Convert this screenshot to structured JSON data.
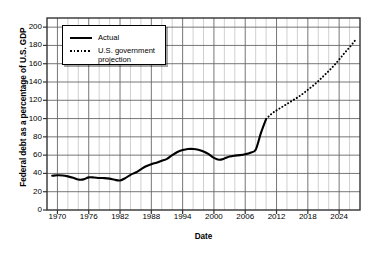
{
  "chart_data": {
    "type": "line",
    "title": "",
    "xlabel": "Date",
    "ylabel": "Federal debt as a percentage of U.S. GDP",
    "xlim": [
      1968,
      1968
    ],
    "ylim": [
      0,
      210
    ],
    "grid": true,
    "legend_position": "top-left",
    "y_ticks": [
      0,
      20,
      40,
      60,
      80,
      100,
      120,
      140,
      160,
      180,
      200
    ],
    "x_ticks": [
      1970,
      1976,
      1982,
      1988,
      1994,
      2000,
      2006,
      2012,
      2018,
      2024
    ],
    "x_minor_step": 2,
    "x_range": [
      1968,
      2028
    ],
    "legend": [
      {
        "label": "Actual",
        "style": "solid"
      },
      {
        "label": "U.S. government\nprojection",
        "style": "dotted"
      }
    ],
    "series": [
      {
        "name": "Actual",
        "style": "solid",
        "x": [
          1969,
          1970,
          1971,
          1972,
          1973,
          1974,
          1975,
          1976,
          1977,
          1978,
          1979,
          1980,
          1981,
          1982,
          1983,
          1984,
          1985,
          1986,
          1987,
          1988,
          1989,
          1990,
          1991,
          1992,
          1993,
          1994,
          1995,
          1996,
          1997,
          1998,
          1999,
          2000,
          2001,
          2002,
          2003,
          2004,
          2005,
          2006,
          2007,
          2008,
          2009,
          2010
        ],
        "values": [
          37.5,
          38.0,
          37.8,
          36.8,
          35.3,
          33.3,
          33.5,
          35.7,
          35.6,
          35.0,
          34.9,
          34.3,
          33.0,
          32.3,
          34.8,
          38.5,
          41.0,
          44.5,
          47.8,
          50.0,
          51.8,
          53.8,
          56.0,
          60.0,
          63.5,
          65.5,
          66.7,
          66.8,
          66.0,
          64.0,
          61.0,
          57.0,
          55.0,
          56.3,
          58.5,
          59.5,
          60.0,
          61.0,
          62.7,
          66.0,
          84.0,
          99.5
        ]
      },
      {
        "name": "U.S. government projection",
        "style": "dotted",
        "x": [
          2010,
          2011,
          2012,
          2013,
          2014,
          2015,
          2016,
          2017,
          2018,
          2019,
          2020,
          2021,
          2022,
          2023,
          2024,
          2025,
          2026,
          2027
        ],
        "values": [
          99.5,
          105.0,
          109.0,
          112.5,
          116.0,
          119.5,
          123.0,
          127.0,
          131.5,
          136.0,
          141.0,
          146.5,
          152.0,
          158.0,
          164.5,
          171.5,
          178.0,
          185.0
        ]
      }
    ]
  },
  "labels": {
    "xlabel": "Date",
    "ylabel": "Federal debt as a percentage of U.S. GDP"
  },
  "caption_fragment": ""
}
